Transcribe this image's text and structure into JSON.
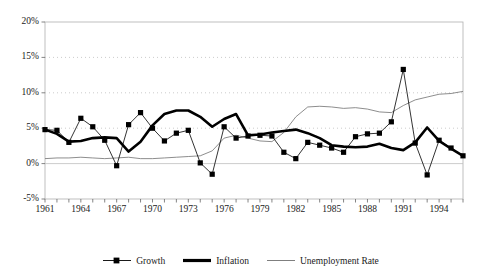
{
  "chart_data": {
    "type": "line",
    "title": "",
    "xlabel": "",
    "ylabel": "",
    "xlim": [
      1961,
      1996
    ],
    "ylim": [
      -5,
      20
    ],
    "ytick_labels": [
      "20%",
      "15%",
      "10%",
      "5%",
      "0%",
      "-5%"
    ],
    "ytick_values": [
      20,
      15,
      10,
      5,
      0,
      -5
    ],
    "xtick_labels": [
      "1961",
      "1964",
      "1967",
      "1970",
      "1973",
      "1976",
      "1979",
      "1982",
      "1985",
      "1988",
      "1991",
      "1994"
    ],
    "xtick_values": [
      1961,
      1964,
      1967,
      1970,
      1973,
      1976,
      1979,
      1982,
      1985,
      1988,
      1991,
      1994
    ],
    "x": [
      1961,
      1962,
      1963,
      1964,
      1965,
      1966,
      1967,
      1968,
      1969,
      1970,
      1971,
      1972,
      1973,
      1974,
      1975,
      1976,
      1977,
      1978,
      1979,
      1980,
      1981,
      1982,
      1983,
      1984,
      1985,
      1986,
      1987,
      1988,
      1989,
      1990,
      1991,
      1992,
      1993,
      1994,
      1995,
      1996
    ],
    "grid": true,
    "legend_position": "bottom",
    "series": [
      {
        "name": "Growth",
        "marker": "square",
        "line_width": 0.8,
        "color": "#000000",
        "values": [
          4.8,
          4.7,
          3.0,
          6.4,
          5.2,
          3.3,
          -0.3,
          5.5,
          7.2,
          5.0,
          3.2,
          4.3,
          4.7,
          0.1,
          -1.5,
          5.2,
          3.6,
          3.9,
          4.0,
          3.9,
          1.6,
          0.7,
          3.0,
          2.6,
          2.2,
          1.6,
          3.8,
          4.2,
          4.3,
          5.9,
          13.3,
          2.9,
          -1.6,
          3.3,
          2.2,
          1.1
        ]
      },
      {
        "name": "Inflation",
        "marker": "none",
        "line_width": 2.6,
        "color": "#000000",
        "values": [
          4.8,
          4.2,
          3.1,
          3.2,
          3.6,
          3.7,
          3.6,
          1.7,
          3.1,
          5.4,
          7.0,
          7.5,
          7.5,
          6.6,
          5.2,
          6.3,
          7.0,
          4.0,
          4.1,
          4.4,
          4.6,
          4.8,
          4.3,
          3.6,
          2.6,
          2.4,
          2.3,
          2.4,
          2.8,
          2.2,
          1.9,
          3.0,
          5.1,
          3.2,
          2.1,
          1.1
        ]
      },
      {
        "name": "Unemployment Rate",
        "marker": "none",
        "line_width": 0.8,
        "color": "#707070",
        "values": [
          0.7,
          0.8,
          0.8,
          0.9,
          0.8,
          0.7,
          0.8,
          0.9,
          0.7,
          0.7,
          0.8,
          0.9,
          1.0,
          1.1,
          1.8,
          3.6,
          4.0,
          3.6,
          3.2,
          3.1,
          4.4,
          6.6,
          8.0,
          8.1,
          8.0,
          7.8,
          7.9,
          7.7,
          7.3,
          7.2,
          8.2,
          9.0,
          9.4,
          9.8,
          9.9,
          10.2
        ]
      }
    ]
  },
  "legend": {
    "items": [
      {
        "label": "Growth",
        "icon": "marker-line-swatch"
      },
      {
        "label": "Inflation",
        "icon": "thick-line-swatch"
      },
      {
        "label": "Unemployment Rate",
        "icon": "thin-line-swatch"
      }
    ]
  }
}
